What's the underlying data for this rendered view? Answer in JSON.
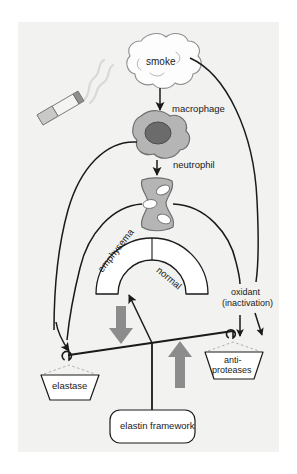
{
  "figure": {
    "background_color": "#f2f2f0",
    "page_color": "#ffffff"
  },
  "labels": {
    "smoke": "smoke",
    "macrophage": "macrophage",
    "neutrophil": "neutrophil",
    "emphysema": "emphysema",
    "normal": "normal",
    "oxidant": "oxidant",
    "inactivation": "(inactivation)",
    "elastase": "elastase",
    "anti": "anti-",
    "proteases": "proteases",
    "elastin_framework": "elastin framework"
  },
  "colors": {
    "stroke": "#1a1a1a",
    "cell_fill": "#b5b5b5",
    "cell_stroke": "#6e6e6e",
    "nucleus_fill": "#6b6b6b",
    "arrow_gray": "#8c8c8c",
    "pan_fill": "#ffffff",
    "string_dashed": "#b0b0b0",
    "cigarette_body": "#f4f4f2",
    "cigarette_filter": "#9a9a9a",
    "smoke_cloud": "#fdfdfd"
  },
  "elements": {
    "cigarette": "cigarette",
    "smoke_cloud": "smoke-cloud",
    "macrophage_cell": "macrophage-cell",
    "neutrophil_cell": "neutrophil-cell",
    "alveolar_arch": "alveolar-arch",
    "balance_beam": "balance-beam",
    "left_pan": "elastase-pan",
    "right_pan": "antiproteases-pan",
    "fulcrum_post": "fulcrum-post",
    "down_arrow": "decrease-arrow",
    "up_arrow": "increase-arrow"
  }
}
